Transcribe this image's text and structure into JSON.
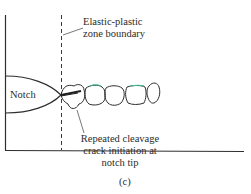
{
  "figure": {
    "panel_label": "(c)",
    "labels": {
      "notch": "Notch",
      "boundary_line1": "Elastic-plastic",
      "boundary_line2": "zone boundary",
      "crack_line1": "Repeated cleavage",
      "crack_line2": "crack initiation at",
      "crack_line3": "notch tip"
    },
    "colors": {
      "line": "#2e2e2e",
      "grain_highlight": "#3fbf8f",
      "background": "#ffffff"
    }
  }
}
